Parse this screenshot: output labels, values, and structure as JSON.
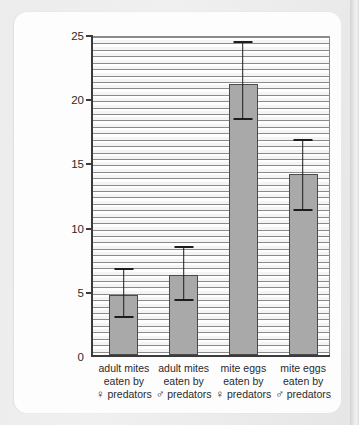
{
  "chart_data": {
    "type": "bar",
    "title": "",
    "xlabel": "",
    "ylabel": "mean number of mites eaten per day",
    "ylim": [
      0,
      25
    ],
    "yticks": [
      0,
      5,
      10,
      15,
      20,
      25
    ],
    "ytick_labels": [
      "0",
      "5",
      "10",
      "15",
      "20",
      "25"
    ],
    "grid": "horizontal-stripes",
    "legend": "none",
    "categories": [
      "adult mites eaten by ♀ predators",
      "adult mites eaten by ♂ predators",
      "mite eggs eaten by ♀ predators",
      "mite eggs eaten by ♂ predators"
    ],
    "category_lines": [
      [
        "adult mites",
        "eaten by",
        "♀ predators"
      ],
      [
        "adult mites",
        "eaten by",
        "♂ predators"
      ],
      [
        "mite eggs",
        "eaten by",
        "♀ predators"
      ],
      [
        "mite eggs",
        "eaten by",
        "♂ predators"
      ]
    ],
    "values": [
      4.7,
      6.2,
      21.1,
      14.1
    ],
    "error_upper": [
      6.6,
      8.3,
      24.3,
      16.7
    ],
    "error_lower": [
      2.9,
      4.2,
      18.3,
      11.2
    ],
    "bar_color": "#a9a9a9",
    "bar_edge_color": "#4a4a4a",
    "error_color": "#1d1d1d",
    "axis_color": "#3b3b3b"
  }
}
